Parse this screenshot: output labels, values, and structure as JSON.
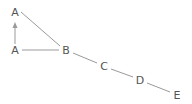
{
  "diagram": {
    "type": "graph",
    "colors": {
      "edge": "#9a9a9a",
      "label": "#555555",
      "background": "#ffffff"
    },
    "nodes": [
      {
        "id": "A_top",
        "label": "A",
        "x": 15,
        "y": 12
      },
      {
        "id": "A_bottom",
        "label": "A",
        "x": 15,
        "y": 50
      },
      {
        "id": "B",
        "label": "B",
        "x": 66,
        "y": 50
      },
      {
        "id": "C",
        "label": "C",
        "x": 104,
        "y": 66
      },
      {
        "id": "D",
        "label": "D",
        "x": 140,
        "y": 80
      },
      {
        "id": "E",
        "label": "E",
        "x": 177,
        "y": 95
      }
    ],
    "edges": [
      {
        "from": "A_bottom",
        "to": "A_top",
        "directed": true
      },
      {
        "from": "A_top",
        "to": "B",
        "directed": false
      },
      {
        "from": "A_bottom",
        "to": "B",
        "directed": false
      },
      {
        "from": "B",
        "to": "C",
        "directed": false
      },
      {
        "from": "C",
        "to": "D",
        "directed": false
      },
      {
        "from": "D",
        "to": "E",
        "directed": false
      }
    ]
  }
}
